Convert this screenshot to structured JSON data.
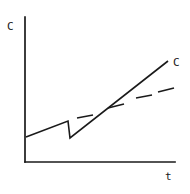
{
  "figure": {
    "name": "concentration-vs-time-plot",
    "background_color": "#ffffff",
    "ink_color": "#1a1a1a"
  },
  "axes": {
    "y_label": "C",
    "x_label": "t",
    "y_axis": {
      "x": 25,
      "y_top": 17,
      "y_bottom": 162
    },
    "x_axis": {
      "y": 162,
      "x_left": 25,
      "x_right": 175
    }
  },
  "annotations": [
    {
      "name": "solid-curve-label",
      "text": "C",
      "x": 173,
      "y": 57
    }
  ],
  "chart_data": {
    "type": "line",
    "title": "",
    "xlabel": "t",
    "ylabel": "C",
    "xlim": [
      0,
      150
    ],
    "ylim": [
      0,
      145
    ],
    "grid": false,
    "legend": "none",
    "series": [
      {
        "name": "solid-curve",
        "style": "solid",
        "color": "#1a1a1a",
        "width": 1.6,
        "points": [
          {
            "x": 26,
            "y": 137
          },
          {
            "x": 68,
            "y": 121
          },
          {
            "x": 70,
            "y": 138
          },
          {
            "x": 168,
            "y": 61
          }
        ],
        "description": "slow rise, sharp drop (sawtooth), then steep linear rise"
      },
      {
        "name": "dashed-curve",
        "style": "dashed",
        "color": "#1a1a1a",
        "width": 1.6,
        "segments": [
          {
            "x1": 77,
            "y1": 118,
            "x2": 93,
            "y2": 115
          },
          {
            "x1": 108,
            "y1": 108,
            "x2": 124,
            "y2": 104
          },
          {
            "x1": 136,
            "y1": 98,
            "x2": 152,
            "y2": 95
          },
          {
            "x1": 158,
            "y1": 92,
            "x2": 174,
            "y2": 88
          }
        ],
        "description": "shallower dashed line crossing the solid curve"
      }
    ]
  }
}
